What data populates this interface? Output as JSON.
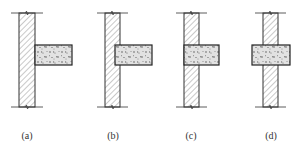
{
  "figure": {
    "panels": [
      {
        "id": "a",
        "label": "(a)",
        "wall": {
          "x": 19,
          "width": 16
        },
        "slab": {
          "x": 35,
          "width": 37
        },
        "label_x": 27
      },
      {
        "id": "b",
        "label": "(b)",
        "wall": {
          "x": 105,
          "width": 15
        },
        "slab": {
          "x": 115,
          "width": 37
        },
        "label_x": 113
      },
      {
        "id": "c",
        "label": "(c)",
        "wall": {
          "x": 184,
          "width": 15
        },
        "slab": {
          "x": 184,
          "width": 35
        },
        "label_x": 191
      },
      {
        "id": "d",
        "label": "(d)",
        "wall": {
          "x": 263,
          "width": 15
        },
        "slab": {
          "x": 252,
          "width": 38
        },
        "label_x": 271
      }
    ],
    "geometry": {
      "wall_top": 13,
      "wall_bottom": 107,
      "slab_top": 45,
      "slab_bottom": 65,
      "label_y": 137,
      "break_line_extension": 8
    },
    "colors": {
      "line": "#333333",
      "hatch": "#666666",
      "concrete_fill": "#e6e6e6",
      "concrete_speckle": "#444444"
    }
  }
}
